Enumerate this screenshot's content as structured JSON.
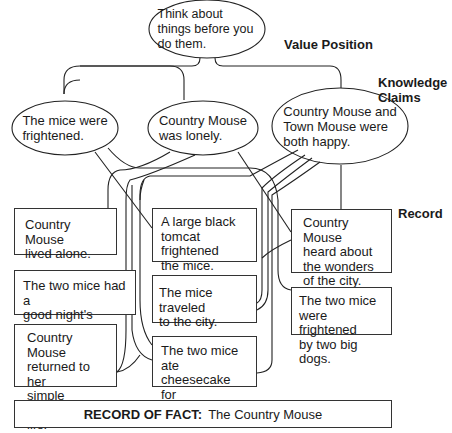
{
  "value_position": {
    "label": "Value Position",
    "text": "Think about things before you do them."
  },
  "knowledge_claims": {
    "label_line1": "Knowledge",
    "label_line2": "Claims",
    "items": [
      {
        "line1": "The mice were",
        "line2": "frightened."
      },
      {
        "line1": "Country Mouse",
        "line2": "was lonely."
      },
      {
        "line1": "Country Mouse and",
        "line2": "Town Mouse were",
        "line3": "both happy."
      }
    ]
  },
  "record": {
    "label": "Record",
    "items": [
      {
        "id": "lived-alone",
        "lines": [
          "Country Mouse",
          "lived alone."
        ]
      },
      {
        "id": "tomcat",
        "lines": [
          "A large black",
          "tomcat frightened",
          "the mice."
        ]
      },
      {
        "id": "heard-wonders",
        "lines": [
          "Country Mouse",
          "heard about",
          "the wonders",
          "of the city."
        ]
      },
      {
        "id": "good-sleep",
        "lines": [
          "The two mice had a",
          "good night's sleep."
        ]
      },
      {
        "id": "traveled",
        "lines": [
          "The mice traveled",
          "to the city."
        ]
      },
      {
        "id": "dogs",
        "lines": [
          "The two mice",
          "were frightened",
          "by two big dogs."
        ]
      },
      {
        "id": "returned",
        "lines": [
          "Country Mouse",
          "returned to her",
          "simple country",
          "life."
        ]
      },
      {
        "id": "cheesecake",
        "lines": [
          "The two mice ate",
          "cheesecake for",
          "dessert."
        ]
      }
    ]
  },
  "record_of_fact": {
    "label": "RECORD OF FACT:",
    "title": "The Country Mouse"
  },
  "colors": {
    "line": "#222222",
    "background": "#ffffff"
  }
}
